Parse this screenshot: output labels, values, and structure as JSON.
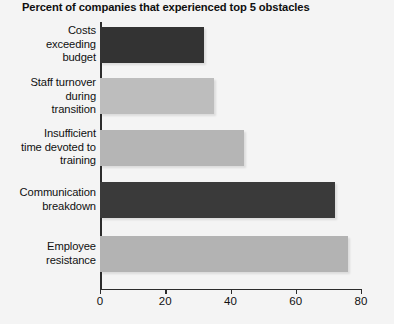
{
  "chart_data": {
    "type": "bar",
    "orientation": "horizontal",
    "title": "Percent of companies that experienced top 5 obstacles",
    "xlabel": "",
    "ylabel": "",
    "xlim": [
      0,
      80
    ],
    "xticks": [
      0,
      20,
      40,
      60,
      80
    ],
    "grid": false,
    "legend": null,
    "categories": [
      "Costs exceeding budget",
      "Staff turnover during transition",
      "Insufficient time devoted to training",
      "Communication breakdown",
      "Employee resistance"
    ],
    "category_lines": [
      [
        "Costs",
        "exceeding",
        "budget"
      ],
      [
        "Staff turnover",
        "during",
        "transition"
      ],
      [
        "Insufficient",
        "time devoted to",
        "training"
      ],
      [
        "Communication",
        "breakdown"
      ],
      [
        "Employee",
        "resistance"
      ]
    ],
    "values": [
      32,
      35,
      44,
      72,
      76
    ],
    "bar_colors": [
      "#333333",
      "#bdbdbd",
      "#b5b5b5",
      "#3a3a3a",
      "#b3b3b3"
    ]
  },
  "colors": {
    "background": "#f4f4f4",
    "axis": "#2c2c2c",
    "text": "#101010",
    "bar_dark": "#333333",
    "bar_light": "#bdbdbd"
  },
  "ticks": {
    "t0": "0",
    "t1": "20",
    "t2": "40",
    "t3": "60",
    "t4": "80"
  }
}
